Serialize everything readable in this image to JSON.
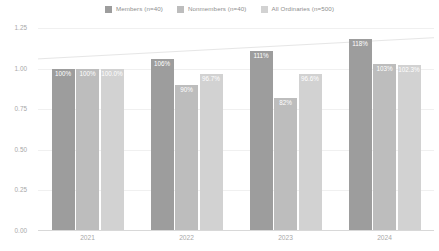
{
  "chart_data": {
    "type": "bar",
    "title": "",
    "subtitle": "",
    "xlabel": "",
    "ylabel": "",
    "categories": [
      "2021",
      "2022",
      "2023",
      "2024"
    ],
    "ylim": [
      0.0,
      1.25
    ],
    "yticks": [
      "1.25",
      "1.00",
      "0.75",
      "0.50",
      "0.25",
      "0.00"
    ],
    "ytick_values": [
      1.25,
      1.0,
      0.75,
      0.5,
      0.25,
      0.0
    ],
    "grid": true,
    "legend_position": "top-center",
    "series": [
      {
        "name": "Members (n=40)",
        "color": "#9d9d9d",
        "values": [
          1.0,
          1.06,
          1.11,
          1.18
        ],
        "labels": [
          "100%",
          "106%",
          "111%",
          "118%"
        ]
      },
      {
        "name": "Nonmembers (n=40)",
        "color": "#bdbdbd",
        "values": [
          1.0,
          0.9,
          0.82,
          1.03
        ],
        "labels": [
          "100%",
          "90%",
          "82%",
          "103%"
        ]
      },
      {
        "name": "All Ordinaries (n=500)",
        "color": "#d2d2d2",
        "values": [
          1.0,
          0.967,
          0.966,
          1.023
        ],
        "labels": [
          "100.0%",
          "96.7%",
          "96.6%",
          "102.3%"
        ]
      }
    ],
    "trendline": {
      "present": true,
      "color": "#e6e6e6",
      "start_value": 1.06,
      "end_value": 1.19
    }
  }
}
